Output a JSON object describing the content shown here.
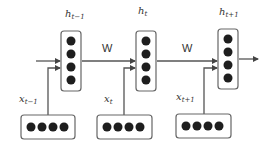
{
  "diagram": {
    "type": "rnn-unrolled",
    "hidden_states": [
      {
        "id": "h_prev",
        "label_base": "h",
        "label_sub": "t−1"
      },
      {
        "id": "h_curr",
        "label_base": "h",
        "label_sub": "t"
      },
      {
        "id": "h_next",
        "label_base": "h",
        "label_sub": "t+1"
      }
    ],
    "inputs": [
      {
        "id": "x_prev",
        "label_base": "x",
        "label_sub": "t−1"
      },
      {
        "id": "x_curr",
        "label_base": "x",
        "label_sub": "t"
      },
      {
        "id": "x_next",
        "label_base": "x",
        "label_sub": "t+1"
      }
    ],
    "weights": [
      {
        "label": "W"
      },
      {
        "label": "W"
      }
    ],
    "units_per_hidden": 4,
    "units_per_input": 4,
    "colors": {
      "line": "#555555",
      "box_stroke": "#666666",
      "unit_fill": "#1e1e1e",
      "text": "#333333"
    }
  }
}
